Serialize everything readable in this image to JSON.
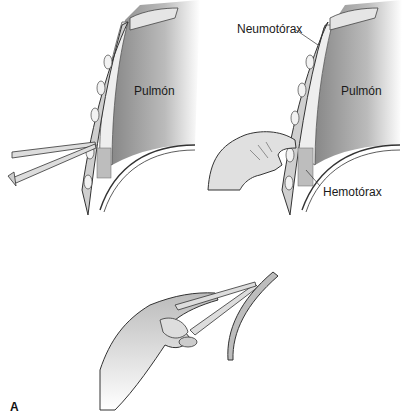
{
  "figure": {
    "panel_label": "A",
    "colors": {
      "lung_dark": "#8a8a8a",
      "lung_light": "#e8e8e8",
      "chest_wall": "#c8c8c8",
      "outline": "#333333",
      "skin": "#d9d9d9",
      "background": "#ffffff"
    }
  },
  "panels": [
    {
      "id": "incision-clamp",
      "labels": {
        "lung": "Pulmón"
      }
    },
    {
      "id": "finger-exploration",
      "labels": {
        "lung": "Pulmón",
        "pneumothorax": "Neumotórax",
        "hemothorax": "Hemotórax"
      }
    },
    {
      "id": "tube-insertion-clamp",
      "labels": {}
    }
  ]
}
